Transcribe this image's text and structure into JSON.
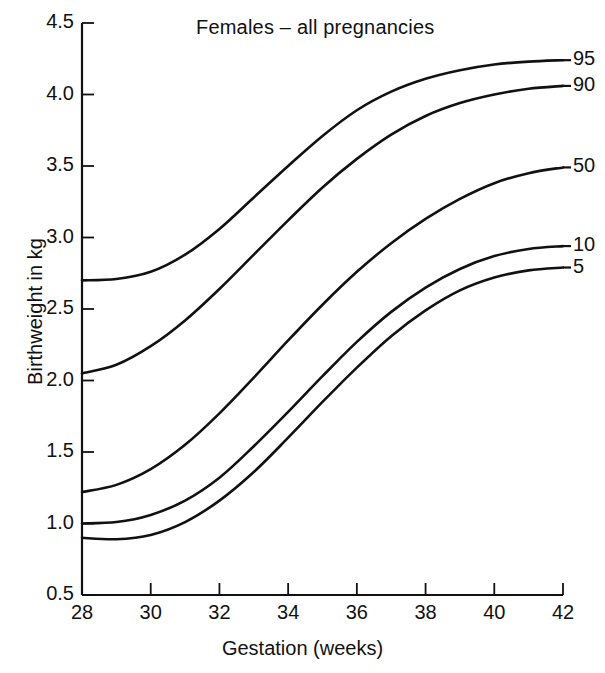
{
  "chart_data": {
    "type": "line",
    "title": "Females – all pregnancies",
    "xlabel": "Gestation (weeks)",
    "ylabel": "Birthweight in kg",
    "xlim": [
      28,
      42
    ],
    "ylim": [
      0.5,
      4.5
    ],
    "xticks": [
      28,
      30,
      32,
      34,
      36,
      38,
      40,
      42
    ],
    "yticks": [
      0.5,
      1.0,
      1.5,
      2.0,
      2.5,
      3.0,
      3.5,
      4.0,
      4.5
    ],
    "xtick_labels": [
      "28",
      "30",
      "32",
      "34",
      "36",
      "38",
      "40",
      "42"
    ],
    "ytick_labels": [
      "0.5",
      "1.0",
      "1.5",
      "2.0",
      "2.5",
      "3.0",
      "3.5",
      "4.0",
      "4.5"
    ],
    "grid": false,
    "legend_position": "right-inline-labels",
    "line_color": "#111111",
    "x": [
      28,
      29,
      30,
      31,
      32,
      33,
      34,
      35,
      36,
      37,
      38,
      39,
      40,
      41,
      42
    ],
    "series": [
      {
        "name": "95",
        "label": "95",
        "values": [
          2.7,
          2.71,
          2.76,
          2.88,
          3.06,
          3.28,
          3.5,
          3.71,
          3.89,
          4.02,
          4.11,
          4.17,
          4.21,
          4.23,
          4.24
        ]
      },
      {
        "name": "90",
        "label": "90",
        "values": [
          2.05,
          2.11,
          2.24,
          2.42,
          2.64,
          2.88,
          3.12,
          3.35,
          3.55,
          3.72,
          3.85,
          3.94,
          4.0,
          4.04,
          4.06
        ]
      },
      {
        "name": "50",
        "label": "50",
        "values": [
          1.22,
          1.27,
          1.38,
          1.55,
          1.77,
          2.02,
          2.28,
          2.53,
          2.76,
          2.96,
          3.13,
          3.27,
          3.38,
          3.45,
          3.49
        ]
      },
      {
        "name": "10",
        "label": "10",
        "values": [
          1.0,
          1.01,
          1.06,
          1.16,
          1.32,
          1.54,
          1.78,
          2.03,
          2.27,
          2.48,
          2.65,
          2.78,
          2.87,
          2.92,
          2.94
        ]
      },
      {
        "name": "5",
        "label": "5",
        "values": [
          0.9,
          0.89,
          0.92,
          1.01,
          1.16,
          1.36,
          1.6,
          1.85,
          2.09,
          2.31,
          2.49,
          2.63,
          2.72,
          2.77,
          2.79
        ]
      }
    ]
  },
  "axis": {
    "x_title": "Gestation (weeks)",
    "y_title": "Birthweight in kg"
  },
  "title": "Females – all pregnancies"
}
